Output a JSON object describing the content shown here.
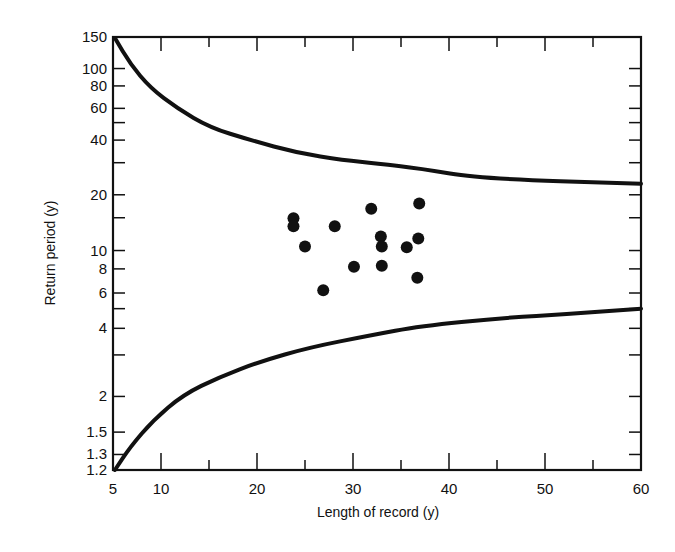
{
  "chart_data": {
    "type": "scatter",
    "title": "",
    "xlabel": "Length of record (y)",
    "ylabel": "Return period (y)",
    "xlim": [
      5,
      60
    ],
    "ylim": [
      1.2,
      150
    ],
    "y_scale": "gumbel",
    "grid": false,
    "legend": null,
    "x_ticks": [
      5,
      10,
      20,
      30,
      40,
      50,
      60
    ],
    "x_minor_ticks": [
      15,
      25,
      35,
      45,
      55
    ],
    "y_ticks": [
      150,
      100,
      80,
      60,
      40,
      20,
      10,
      8,
      6,
      4,
      2,
      1.5,
      1.3,
      1.2
    ],
    "y_tick_labels": [
      "150",
      "100",
      "80",
      "60",
      "40",
      "20",
      "10",
      "8",
      "6",
      "4",
      "2",
      "1.5",
      "1.3",
      "1.2"
    ],
    "y_minor_ticks": [
      50,
      30,
      15,
      5,
      3
    ],
    "series": [
      {
        "name": "Observed points",
        "type": "scatter",
        "points": [
          {
            "x": 23.8,
            "y": 14.9
          },
          {
            "x": 23.8,
            "y": 13.5
          },
          {
            "x": 25.0,
            "y": 10.5
          },
          {
            "x": 26.9,
            "y": 6.2
          },
          {
            "x": 28.1,
            "y": 13.5
          },
          {
            "x": 30.1,
            "y": 8.2
          },
          {
            "x": 31.9,
            "y": 16.8
          },
          {
            "x": 32.9,
            "y": 11.9
          },
          {
            "x": 33.0,
            "y": 10.5
          },
          {
            "x": 33.0,
            "y": 8.3
          },
          {
            "x": 35.6,
            "y": 10.4
          },
          {
            "x": 36.7,
            "y": 7.2
          },
          {
            "x": 36.8,
            "y": 11.6
          },
          {
            "x": 36.9,
            "y": 17.9
          }
        ]
      },
      {
        "name": "Upper limit",
        "type": "line",
        "points": [
          {
            "x": 5.2,
            "y": 148
          },
          {
            "x": 6.8,
            "y": 106
          },
          {
            "x": 8.9,
            "y": 78
          },
          {
            "x": 11.7,
            "y": 60
          },
          {
            "x": 15.1,
            "y": 47
          },
          {
            "x": 19.3,
            "y": 40
          },
          {
            "x": 24.2,
            "y": 34
          },
          {
            "x": 29.0,
            "y": 31
          },
          {
            "x": 32.5,
            "y": 29.7
          },
          {
            "x": 37.0,
            "y": 27.9
          },
          {
            "x": 43.2,
            "y": 24.5
          },
          {
            "x": 60.0,
            "y": 23
          }
        ]
      },
      {
        "name": "Lower limit",
        "type": "line",
        "points": [
          {
            "x": 5.2,
            "y": 1.2
          },
          {
            "x": 6.8,
            "y": 1.36
          },
          {
            "x": 9.2,
            "y": 1.64
          },
          {
            "x": 12.3,
            "y": 2.03
          },
          {
            "x": 16.1,
            "y": 2.4
          },
          {
            "x": 20.3,
            "y": 2.8
          },
          {
            "x": 25.5,
            "y": 3.25
          },
          {
            "x": 31.8,
            "y": 3.7
          },
          {
            "x": 37.0,
            "y": 4.1
          },
          {
            "x": 45.6,
            "y": 4.5
          },
          {
            "x": 52.6,
            "y": 4.7
          },
          {
            "x": 60.0,
            "y": 5.0
          }
        ]
      }
    ]
  },
  "colors": {
    "ink": "#111111",
    "background": "#ffffff"
  }
}
